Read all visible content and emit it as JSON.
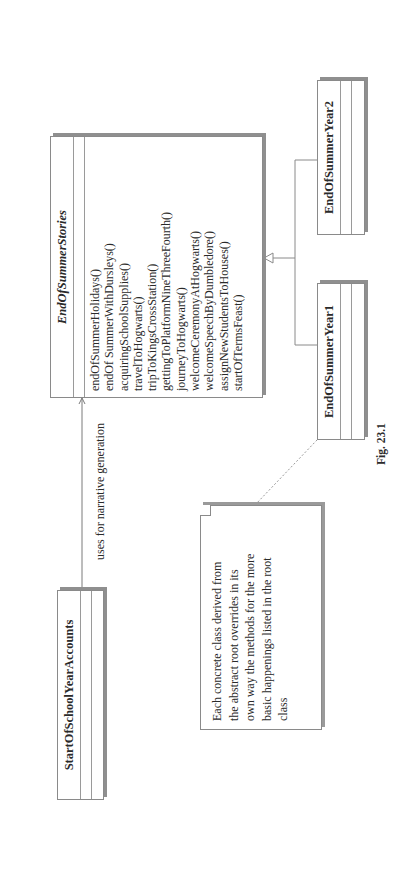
{
  "diagram": {
    "type": "UML class diagram",
    "orientation": "rotated 90deg counter-clockwise",
    "classes": {
      "root": {
        "name": "EndOfSummerStories",
        "abstract": true,
        "attributes": [],
        "operations": [
          "endOfSummerHolidays()",
          "endOf SummerWithDursleys()",
          "acquiringSchoolSupplies()",
          "travelToHogwarts()",
          "tripToKingsCrossStation()",
          "gettingToPlatformNineThreeFourth()",
          "journeyToHogwarts()",
          "welcomeCeremonyAtHogwarts()",
          "welcomeSpeechByDumbledore()",
          "assignNewStudentsToHouses()",
          "startOfTermsFeast()"
        ]
      },
      "client": {
        "name": "StartOfSchoolYearAccounts",
        "attributes": [],
        "operations": []
      },
      "year1": {
        "name": "EndOfSummerYear1",
        "attributes": [],
        "operations": []
      },
      "year2": {
        "name": "EndOfSummerYear2",
        "attributes": [],
        "operations": []
      }
    },
    "relationships": [
      {
        "type": "association",
        "from": "StartOfSchoolYearAccounts",
        "to": "EndOfSummerStories",
        "label": "uses for narrative generation"
      },
      {
        "type": "generalization",
        "from": "EndOfSummerYear1",
        "to": "EndOfSummerStories"
      },
      {
        "type": "generalization",
        "from": "EndOfSummerYear2",
        "to": "EndOfSummerStories"
      },
      {
        "type": "note-anchor",
        "from": "note",
        "to": "EndOfSummerYear1"
      }
    ],
    "association_label": "uses for narrative generation",
    "note": {
      "lines": [
        "Each concrete class derived from",
        "the abstract root overrides in its",
        "own way the methods for the more",
        "basic happenings listed in the root",
        "class"
      ]
    },
    "caption": "Fig. 23.1",
    "colors": {
      "line": "#8a8a8a",
      "shadow": "#8f8f8f",
      "text": "#2a2a2a",
      "background": "#ffffff"
    }
  }
}
